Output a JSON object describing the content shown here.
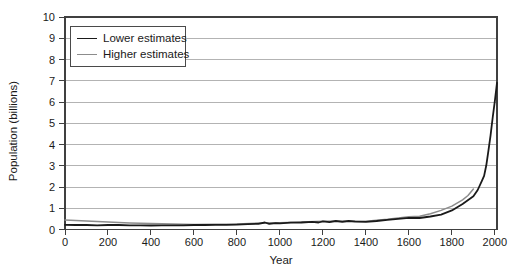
{
  "page": {
    "background": "#ffffff"
  },
  "chart_data": {
    "type": "line",
    "title": "",
    "xlabel": "Year",
    "ylabel": "Population (billions)",
    "xlim": [
      0,
      2010
    ],
    "ylim": [
      0,
      10
    ],
    "x_ticks": [
      0,
      200,
      400,
      600,
      800,
      1000,
      1200,
      1400,
      1600,
      1800,
      2000
    ],
    "y_ticks": [
      0,
      1,
      2,
      3,
      4,
      5,
      6,
      7,
      8,
      9,
      10
    ],
    "grid": "horizontal-only",
    "legend_position": "top-left",
    "axis_color": "#404040",
    "gridline_color": "#b3b3b3",
    "text_color": "#1a1a1a",
    "series": [
      {
        "name": "Lower estimates",
        "color": "#1a1a1a",
        "stroke_width": 1.8,
        "points": [
          [
            0,
            0.22
          ],
          [
            50,
            0.21
          ],
          [
            100,
            0.21
          ],
          [
            150,
            0.2
          ],
          [
            200,
            0.21
          ],
          [
            250,
            0.21
          ],
          [
            300,
            0.2
          ],
          [
            350,
            0.2
          ],
          [
            400,
            0.19
          ],
          [
            450,
            0.2
          ],
          [
            500,
            0.2
          ],
          [
            550,
            0.2
          ],
          [
            600,
            0.21
          ],
          [
            650,
            0.21
          ],
          [
            700,
            0.22
          ],
          [
            750,
            0.22
          ],
          [
            800,
            0.23
          ],
          [
            850,
            0.25
          ],
          [
            900,
            0.27
          ],
          [
            930,
            0.33
          ],
          [
            950,
            0.27
          ],
          [
            980,
            0.3
          ],
          [
            1000,
            0.29
          ],
          [
            1050,
            0.32
          ],
          [
            1100,
            0.33
          ],
          [
            1150,
            0.36
          ],
          [
            1180,
            0.33
          ],
          [
            1200,
            0.38
          ],
          [
            1230,
            0.35
          ],
          [
            1260,
            0.4
          ],
          [
            1290,
            0.36
          ],
          [
            1320,
            0.4
          ],
          [
            1350,
            0.37
          ],
          [
            1400,
            0.36
          ],
          [
            1450,
            0.4
          ],
          [
            1500,
            0.45
          ],
          [
            1550,
            0.5
          ],
          [
            1600,
            0.55
          ],
          [
            1650,
            0.54
          ],
          [
            1700,
            0.61
          ],
          [
            1750,
            0.7
          ],
          [
            1800,
            0.9
          ],
          [
            1850,
            1.2
          ],
          [
            1900,
            1.56
          ],
          [
            1920,
            1.86
          ],
          [
            1940,
            2.3
          ],
          [
            1950,
            2.52
          ],
          [
            1960,
            3.02
          ],
          [
            1970,
            3.7
          ],
          [
            1980,
            4.44
          ],
          [
            1990,
            5.27
          ],
          [
            2000,
            6.06
          ],
          [
            2010,
            6.9
          ]
        ]
      },
      {
        "name": "Higher estimates",
        "color": "#8c8c8c",
        "stroke_width": 1.5,
        "points": [
          [
            0,
            0.45
          ],
          [
            100,
            0.4
          ],
          [
            200,
            0.35
          ],
          [
            300,
            0.31
          ],
          [
            400,
            0.28
          ],
          [
            500,
            0.26
          ],
          [
            600,
            0.24
          ],
          [
            700,
            0.25
          ],
          [
            800,
            0.26
          ],
          [
            900,
            0.3
          ],
          [
            1000,
            0.32
          ],
          [
            1100,
            0.35
          ],
          [
            1200,
            0.39
          ],
          [
            1300,
            0.4
          ],
          [
            1400,
            0.39
          ],
          [
            1500,
            0.48
          ],
          [
            1550,
            0.54
          ],
          [
            1600,
            0.6
          ],
          [
            1650,
            0.62
          ],
          [
            1700,
            0.74
          ],
          [
            1750,
            0.9
          ],
          [
            1800,
            1.1
          ],
          [
            1850,
            1.4
          ],
          [
            1875,
            1.6
          ],
          [
            1900,
            1.9
          ]
        ]
      }
    ]
  }
}
